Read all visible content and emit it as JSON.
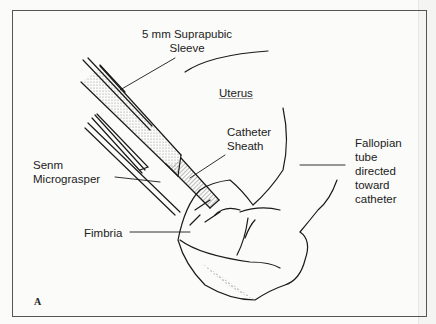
{
  "figure": {
    "panel_letter": "A",
    "labels": {
      "suprapubic_sleeve": "5 mm Suprapubic\nSleeve",
      "uterus": "Uterus",
      "catheter_sheath": "Catheter\nSheath",
      "micrograsper": "Senm\nMicrograsper",
      "fallopian_tube": "Fallopian\ntube\ndirected\ntoward\ncatheter",
      "fimbria": "Fimbria"
    }
  }
}
